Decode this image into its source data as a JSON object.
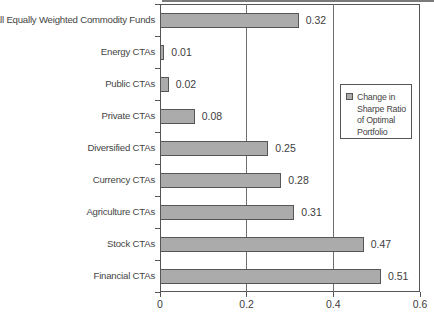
{
  "chart_data": {
    "type": "bar",
    "orientation": "horizontal",
    "title": "",
    "xlabel": "",
    "ylabel": "",
    "categories": [
      "All Equally Weighted Commodity Funds",
      "Energy CTAs",
      "Public CTAs",
      "Private CTAs",
      "Diversified CTAs",
      "Currency CTAs",
      "Agriculture CTAs",
      "Stock CTAs",
      "Financial CTAs"
    ],
    "values": [
      0.32,
      0.01,
      0.02,
      0.08,
      0.25,
      0.28,
      0.31,
      0.47,
      0.51
    ],
    "value_labels": [
      "0.32",
      "0.01",
      "0.02",
      "0.08",
      "0.25",
      "0.28",
      "0.31",
      "0.47",
      "0.51"
    ],
    "xlim": [
      0,
      0.6
    ],
    "x_ticks": [
      0,
      0.2,
      0.4,
      0.6
    ],
    "x_tick_labels": [
      "0",
      "0.2",
      "0.4",
      "0.6"
    ],
    "grid": "vertical gridlines at inner x ticks, drawn behind bars",
    "legend": {
      "label": "Change in\nSharpe Ratio\nof Optimal\nPortfolio",
      "position": "inside-right"
    },
    "colors": {
      "bar_fill": "#ababab",
      "bar_border": "#565656",
      "axis": "#555555",
      "background": "#ffffff"
    }
  }
}
